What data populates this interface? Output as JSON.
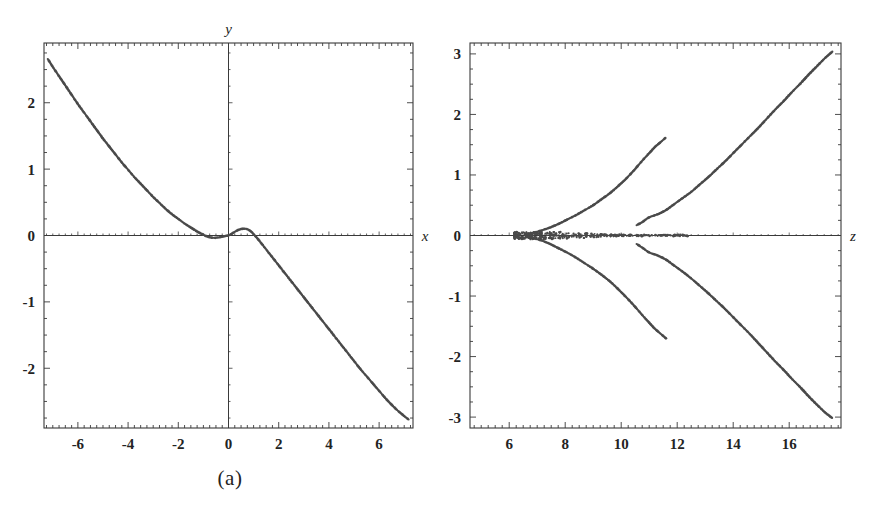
{
  "figure": {
    "background_color": "#ffffff",
    "ink_color": "#3a3a3a",
    "curve_color": "#4a4a4a",
    "panels": [
      {
        "id": "a",
        "caption": "(a)",
        "xlabel": "x",
        "ylabel": "y",
        "xlabel_position": "axis-right-end",
        "ylabel_position": "axis-top-end"
      },
      {
        "id": "b",
        "caption": "(b)",
        "xlabel": "z",
        "ylabel": "",
        "xlabel_position": "axis-right-end",
        "ylabel_position": "none"
      }
    ]
  },
  "chart_data": [
    {
      "type": "scatter",
      "panel": "a",
      "title": "",
      "subtitle": "",
      "caption": "(a)",
      "xlabel": "x",
      "ylabel": "y",
      "xlim": [
        -7.35,
        7.35
      ],
      "ylim": [
        -2.9,
        2.9
      ],
      "xticks": [
        -6,
        -4,
        -2,
        0,
        2,
        4,
        6
      ],
      "xticklabels": [
        "-6",
        "-4",
        "-2",
        "0",
        "2",
        "4",
        "6"
      ],
      "yticks": [
        -2,
        -1,
        0,
        1,
        2
      ],
      "yticklabels": [
        "-2",
        "-1",
        "0",
        "1",
        "2"
      ],
      "minor_tick_step": 0.25,
      "grid": false,
      "legend": "none",
      "axes_style": "frame-with-crosshair-axes",
      "marker": "small-dot",
      "series": [
        {
          "name": "branch",
          "comment": "single descending odd-symmetric curve with small oscillation near origin",
          "x": [
            -7.2,
            -7.0,
            -6.75,
            -6.5,
            -6.25,
            -6.0,
            -5.75,
            -5.5,
            -5.25,
            -5.0,
            -4.75,
            -4.5,
            -4.25,
            -4.0,
            -3.75,
            -3.5,
            -3.25,
            -3.0,
            -2.75,
            -2.5,
            -2.25,
            -2.0,
            -1.75,
            -1.5,
            -1.25,
            -1.0,
            -0.85,
            -0.7,
            -0.55,
            -0.4,
            -0.25,
            -0.1,
            0.0,
            0.1,
            0.25,
            0.4,
            0.55,
            0.7,
            0.85,
            1.0,
            1.25,
            1.5,
            1.75,
            2.0,
            2.25,
            2.5,
            2.75,
            3.0,
            3.25,
            3.5,
            3.75,
            4.0,
            4.25,
            4.5,
            4.75,
            5.0,
            5.25,
            5.5,
            5.75,
            6.0,
            6.25,
            6.5,
            6.75,
            7.0,
            7.2
          ],
          "y": [
            2.66,
            2.54,
            2.4,
            2.26,
            2.12,
            1.98,
            1.85,
            1.72,
            1.59,
            1.46,
            1.34,
            1.22,
            1.1,
            0.99,
            0.88,
            0.78,
            0.68,
            0.58,
            0.49,
            0.4,
            0.32,
            0.25,
            0.18,
            0.12,
            0.06,
            0.01,
            -0.015,
            -0.03,
            -0.035,
            -0.03,
            -0.02,
            -0.005,
            0.0,
            0.02,
            0.055,
            0.085,
            0.1,
            0.1,
            0.075,
            0.02,
            -0.09,
            -0.21,
            -0.33,
            -0.45,
            -0.57,
            -0.69,
            -0.81,
            -0.93,
            -1.05,
            -1.17,
            -1.29,
            -1.41,
            -1.53,
            -1.65,
            -1.77,
            -1.89,
            -2.01,
            -2.12,
            -2.23,
            -2.34,
            -2.45,
            -2.55,
            -2.64,
            -2.72,
            -2.78
          ]
        }
      ]
    },
    {
      "type": "scatter",
      "panel": "b",
      "title": "",
      "subtitle": "",
      "caption": "(b)",
      "xlabel": "z",
      "ylabel": "",
      "xlim": [
        4.6,
        17.85
      ],
      "ylim": [
        -3.18,
        3.18
      ],
      "xticks": [
        6,
        8,
        10,
        12,
        14,
        16
      ],
      "xticklabels": [
        "6",
        "8",
        "10",
        "12",
        "14",
        "16"
      ],
      "yticks": [
        -3,
        -2,
        -1,
        0,
        1,
        2,
        3
      ],
      "yticklabels": [
        "-3",
        "-2",
        "-1",
        "0",
        "1",
        "2",
        "3"
      ],
      "minor_tick_step": 0.25,
      "grid": false,
      "legend": "none",
      "axes_style": "frame-with-horizontal-axis",
      "marker": "small-dot",
      "series": [
        {
          "name": "inner-upper-branch",
          "x": [
            6.6,
            6.9,
            7.2,
            7.5,
            7.8,
            8.1,
            8.4,
            8.7,
            9.0,
            9.3,
            9.6,
            9.9,
            10.2,
            10.5,
            10.8,
            11.0,
            11.2,
            11.35,
            11.5,
            11.6
          ],
          "y": [
            0.02,
            0.05,
            0.09,
            0.14,
            0.2,
            0.27,
            0.34,
            0.42,
            0.5,
            0.6,
            0.7,
            0.82,
            0.95,
            1.1,
            1.26,
            1.36,
            1.46,
            1.52,
            1.58,
            1.62
          ]
        },
        {
          "name": "inner-lower-branch",
          "x": [
            6.6,
            6.9,
            7.2,
            7.5,
            7.8,
            8.1,
            8.4,
            8.7,
            9.0,
            9.3,
            9.6,
            9.9,
            10.2,
            10.5,
            10.8,
            11.0,
            11.2,
            11.35,
            11.5,
            11.6
          ],
          "y": [
            -0.02,
            -0.05,
            -0.09,
            -0.15,
            -0.22,
            -0.29,
            -0.37,
            -0.46,
            -0.55,
            -0.65,
            -0.76,
            -0.89,
            -1.03,
            -1.18,
            -1.34,
            -1.44,
            -1.54,
            -1.6,
            -1.66,
            -1.7
          ]
        },
        {
          "name": "outer-upper-branch",
          "x": [
            10.55,
            10.75,
            11.0,
            11.3,
            11.6,
            11.9,
            12.2,
            12.5,
            12.8,
            13.1,
            13.4,
            13.7,
            14.0,
            14.3,
            14.6,
            14.9,
            15.2,
            15.5,
            15.8,
            16.1,
            16.4,
            16.7,
            17.0,
            17.3,
            17.55
          ],
          "y": [
            0.17,
            0.22,
            0.3,
            0.35,
            0.42,
            0.52,
            0.62,
            0.72,
            0.84,
            0.96,
            1.09,
            1.22,
            1.36,
            1.5,
            1.64,
            1.78,
            1.93,
            2.08,
            2.22,
            2.37,
            2.51,
            2.66,
            2.8,
            2.94,
            3.04
          ]
        },
        {
          "name": "outer-lower-branch",
          "x": [
            10.55,
            10.75,
            11.0,
            11.3,
            11.6,
            11.9,
            12.2,
            12.5,
            12.8,
            13.1,
            13.4,
            13.7,
            14.0,
            14.3,
            14.6,
            14.9,
            15.2,
            15.5,
            15.8,
            16.1,
            16.4,
            16.7,
            17.0,
            17.3,
            17.55
          ],
          "y": [
            -0.14,
            -0.2,
            -0.28,
            -0.33,
            -0.4,
            -0.5,
            -0.6,
            -0.71,
            -0.83,
            -0.95,
            -1.08,
            -1.21,
            -1.35,
            -1.49,
            -1.63,
            -1.78,
            -1.93,
            -2.08,
            -2.22,
            -2.37,
            -2.51,
            -2.66,
            -2.8,
            -2.93,
            -3.02
          ]
        },
        {
          "name": "axis-cluster",
          "comment": "dense scatter of points lying on and near y=0 between z=4.7 and z=10.9",
          "x": [
            4.75,
            4.95,
            5.15,
            5.35,
            5.55,
            5.75,
            5.95,
            6.1,
            6.25,
            6.4,
            6.5,
            6.6,
            6.7,
            6.8,
            6.85,
            6.9,
            6.95,
            7.0,
            7.05,
            7.1,
            7.15,
            7.2,
            7.3,
            7.4,
            7.5,
            7.65,
            7.8,
            7.95,
            8.1,
            8.25,
            8.4,
            8.55,
            8.7,
            8.85,
            9.0,
            9.15,
            9.3,
            9.45,
            9.6,
            9.8,
            10.0,
            10.2,
            10.4,
            10.6,
            10.8
          ],
          "y": [
            0.0,
            0.0,
            0.0,
            0.0,
            0.0,
            0.0,
            0.0,
            0.0,
            0.0,
            0.0,
            0.0,
            0.0,
            0.0,
            0.0,
            0.0,
            0.0,
            0.0,
            0.0,
            0.0,
            0.0,
            0.0,
            0.0,
            0.0,
            0.0,
            0.0,
            0.0,
            0.0,
            0.0,
            0.0,
            0.0,
            0.0,
            0.0,
            0.0,
            0.0,
            0.0,
            0.0,
            0.0,
            0.0,
            0.0,
            0.0,
            0.0,
            0.0,
            0.0,
            0.0,
            0.0
          ]
        }
      ]
    }
  ]
}
